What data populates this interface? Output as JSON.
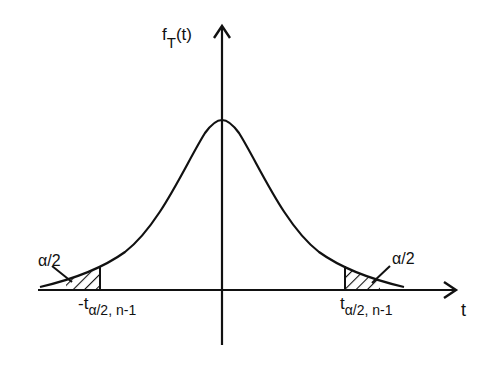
{
  "diagram": {
    "type": "t-distribution density with two-tailed rejection regions",
    "y_axis_label": {
      "main": "f",
      "sub": "T",
      "rest": "(t)"
    },
    "x_axis_label": "t",
    "left_tail_label": "α/2",
    "right_tail_label": "α/2",
    "left_critical": {
      "prefix": "-t",
      "sub": "α/2, n-1"
    },
    "right_critical": {
      "prefix": "t",
      "sub": "α/2, n-1"
    },
    "colors": {
      "stroke": "#111111",
      "background": "#ffffff"
    }
  }
}
